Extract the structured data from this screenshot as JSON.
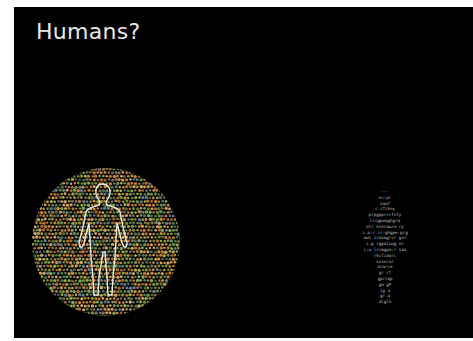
{
  "slide": {
    "title": "Humans?",
    "background_color": "#000000",
    "title_color": "#e8e8e8"
  },
  "left_figure": {
    "type": "color-dot-plate-with-human-outline",
    "dot_colors": [
      "#b8742e",
      "#c98a3a",
      "#6f8f3a",
      "#8aa84a",
      "#4f6e4a",
      "#9a6a3a",
      "#d0a060",
      "#5f7a8a"
    ],
    "outline_color": "#e8e8e0"
  },
  "right_figure": {
    "type": "human-silhouette-made-of-text",
    "text_color": "#bfbfbf",
    "lines": [
      "---",
      "nc:pr",
      "sauf",
      "r.cfckny",
      "prpgpprrcfvty",
      "ircgpwaghgra",
      "ntr  ksnrawre  ry",
      "i.a:r  ir:ghgpe  grg",
      "aus  irasagrcr  gor",
      "i.g  rgpaluug  nr",
      "c;u  lrcmgpa:r  sas",
      "rhctidarc",
      "sxsnrur",
      "ararce",
      "gr  rt",
      "gprcqp",
      "ga  gP",
      "ig  a",
      "gr  a",
      "dlgln"
    ]
  }
}
